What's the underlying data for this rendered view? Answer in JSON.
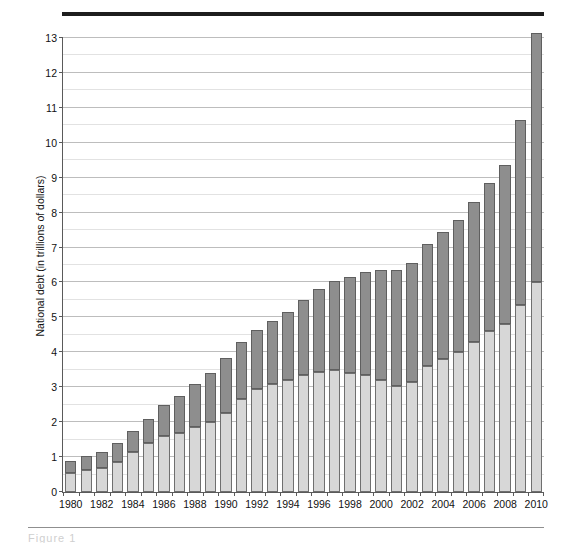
{
  "figure": {
    "y_axis_title": "National debt (in trillions of dollars)",
    "caption_fragment": "Figure 1"
  },
  "chart_data": {
    "type": "bar",
    "stacked": true,
    "title": "",
    "xlabel": "",
    "ylabel": "National debt (in trillions of dollars)",
    "ylim": [
      0,
      13
    ],
    "ytick_labels": [
      "0",
      "1",
      "2",
      "3",
      "4",
      "5",
      "6",
      "7",
      "8",
      "9",
      "10",
      "11",
      "12",
      "13"
    ],
    "ytick_values": [
      0,
      1,
      2,
      3,
      4,
      5,
      6,
      7,
      8,
      9,
      10,
      11,
      12,
      13
    ],
    "minor_gridline_interval": 0.5,
    "grid": true,
    "legend": "none",
    "xtick_labels": [
      "1980",
      "1982",
      "1984",
      "1986",
      "1988",
      "1990",
      "1992",
      "1994",
      "1996",
      "1998",
      "2000",
      "2002",
      "2004",
      "2006",
      "2008",
      "2010"
    ],
    "categories": [
      "1980",
      "1981",
      "1982",
      "1983",
      "1984",
      "1985",
      "1986",
      "1987",
      "1988",
      "1989",
      "1990",
      "1991",
      "1992",
      "1993",
      "1994",
      "1995",
      "1996",
      "1997",
      "1998",
      "1999",
      "2000",
      "2001",
      "2002",
      "2003",
      "2004",
      "2005",
      "2006",
      "2007",
      "2008",
      "2009",
      "2010"
    ],
    "series": [
      {
        "name": "Debt held by the public",
        "color": "#d7d7d7",
        "values": [
          0.55,
          0.62,
          0.7,
          0.85,
          1.15,
          1.4,
          1.6,
          1.7,
          1.85,
          2.0,
          2.25,
          2.65,
          2.95,
          3.1,
          3.2,
          3.35,
          3.45,
          3.5,
          3.4,
          3.35,
          3.2,
          3.05,
          3.15,
          3.6,
          3.8,
          4.0,
          4.3,
          4.6,
          4.8,
          5.35,
          6.0
        ]
      },
      {
        "name": "Intragovernmental holdings",
        "color": "#8e8e8e",
        "values": [
          0.35,
          0.4,
          0.45,
          0.55,
          0.6,
          0.7,
          0.9,
          1.05,
          1.25,
          1.4,
          1.6,
          1.65,
          1.7,
          1.8,
          1.95,
          2.15,
          2.35,
          2.55,
          2.75,
          2.95,
          3.15,
          3.3,
          3.4,
          3.5,
          3.65,
          3.8,
          4.0,
          4.25,
          4.55,
          5.3,
          7.15
        ]
      }
    ],
    "totals": [
      0.9,
      1.02,
      1.15,
      1.4,
      1.75,
      2.1,
      2.5,
      2.75,
      3.1,
      3.4,
      3.85,
      4.3,
      4.65,
      4.9,
      5.15,
      5.5,
      5.8,
      6.05,
      6.15,
      6.3,
      6.35,
      6.35,
      6.55,
      7.1,
      7.45,
      7.8,
      8.3,
      8.85,
      9.35,
      10.65,
      13.15
    ]
  }
}
